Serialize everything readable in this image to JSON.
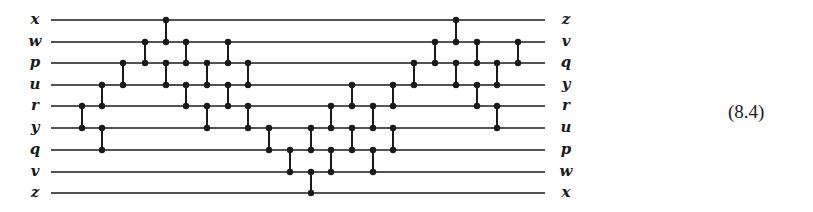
{
  "equation_number": "(8.4)",
  "colors": {
    "ink": "#1a1a1a",
    "background": "#ffffff"
  },
  "wires": {
    "x_start": 51,
    "x_end": 545,
    "left_labels": [
      "x",
      "w",
      "p",
      "u",
      "r",
      "y",
      "q",
      "v",
      "z"
    ],
    "right_labels": [
      "z",
      "v",
      "q",
      "y",
      "r",
      "u",
      "p",
      "w",
      "x"
    ],
    "y_positions": [
      20,
      42,
      63,
      85,
      106,
      128,
      150,
      172,
      193
    ]
  },
  "comparators": [
    {
      "x": 82,
      "pairs": [
        [
          4,
          5
        ]
      ]
    },
    {
      "x": 102,
      "pairs": [
        [
          3,
          4
        ],
        [
          5,
          6
        ]
      ]
    },
    {
      "x": 123,
      "pairs": [
        [
          2,
          3
        ]
      ]
    },
    {
      "x": 145,
      "pairs": [
        [
          1,
          2
        ]
      ]
    },
    {
      "x": 166,
      "pairs": [
        [
          0,
          1
        ],
        [
          2,
          3
        ]
      ]
    },
    {
      "x": 186,
      "pairs": [
        [
          1,
          2
        ],
        [
          3,
          4
        ]
      ]
    },
    {
      "x": 207,
      "pairs": [
        [
          2,
          3
        ],
        [
          4,
          5
        ]
      ]
    },
    {
      "x": 228,
      "pairs": [
        [
          1,
          2
        ],
        [
          3,
          4
        ]
      ]
    },
    {
      "x": 248,
      "pairs": [
        [
          2,
          3
        ],
        [
          4,
          5
        ]
      ]
    },
    {
      "x": 269,
      "pairs": [
        [
          5,
          6
        ]
      ]
    },
    {
      "x": 290,
      "pairs": [
        [
          6,
          7
        ]
      ]
    },
    {
      "x": 311,
      "pairs": [
        [
          5,
          6
        ],
        [
          7,
          8
        ]
      ]
    },
    {
      "x": 331,
      "pairs": [
        [
          4,
          5
        ],
        [
          6,
          7
        ]
      ]
    },
    {
      "x": 352,
      "pairs": [
        [
          3,
          4
        ],
        [
          5,
          6
        ]
      ]
    },
    {
      "x": 373,
      "pairs": [
        [
          4,
          5
        ],
        [
          6,
          7
        ]
      ]
    },
    {
      "x": 393,
      "pairs": [
        [
          3,
          4
        ],
        [
          5,
          6
        ]
      ]
    },
    {
      "x": 414,
      "pairs": [
        [
          2,
          3
        ]
      ]
    },
    {
      "x": 435,
      "pairs": [
        [
          1,
          2
        ]
      ]
    },
    {
      "x": 456,
      "pairs": [
        [
          0,
          1
        ],
        [
          2,
          3
        ]
      ]
    },
    {
      "x": 477,
      "pairs": [
        [
          1,
          2
        ],
        [
          3,
          4
        ]
      ]
    },
    {
      "x": 497,
      "pairs": [
        [
          2,
          3
        ],
        [
          4,
          5
        ]
      ]
    },
    {
      "x": 518,
      "pairs": [
        [
          1,
          2
        ]
      ]
    }
  ]
}
